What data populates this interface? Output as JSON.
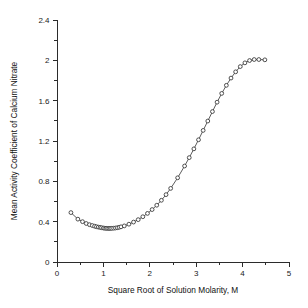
{
  "chart_data": {
    "type": "scatter",
    "title": "",
    "xlabel": "Square Root of Solution Molarity, M",
    "ylabel": "Mean Activity Coefficient of Calcium Nitrate",
    "xlim": [
      0,
      5
    ],
    "ylim": [
      0,
      2.4
    ],
    "xticks": [
      0,
      1,
      2,
      3,
      4,
      5
    ],
    "yticks": [
      0,
      0.4,
      0.8,
      1.2,
      1.6,
      2,
      2.4
    ],
    "xtick_labels": [
      "0",
      "1",
      "2",
      "3",
      "4",
      "5"
    ],
    "ytick_labels": [
      "0",
      "0.4",
      "0.8",
      "1.2",
      "1.6",
      "2",
      "2.4"
    ],
    "xminor_step": 0.5,
    "yminor_step": 0.2,
    "grid": false,
    "legend": null,
    "marker": "open-circle",
    "line_style": "solid",
    "line_color": "#4a4a4a",
    "marker_edge_color": "#333333",
    "marker_face_color": "#ffffff",
    "axis_color": "#2b2b2b",
    "background_color": "#ffffff",
    "series": [
      {
        "name": "Calcium Nitrate",
        "points": [
          [
            0.3,
            0.49
          ],
          [
            0.45,
            0.425
          ],
          [
            0.55,
            0.4
          ],
          [
            0.63,
            0.382
          ],
          [
            0.7,
            0.37
          ],
          [
            0.76,
            0.362
          ],
          [
            0.81,
            0.355
          ],
          [
            0.85,
            0.35
          ],
          [
            0.89,
            0.346
          ],
          [
            0.93,
            0.343
          ],
          [
            0.96,
            0.34
          ],
          [
            1.0,
            0.337
          ],
          [
            1.03,
            0.335
          ],
          [
            1.06,
            0.334
          ],
          [
            1.09,
            0.333
          ],
          [
            1.12,
            0.333
          ],
          [
            1.15,
            0.333
          ],
          [
            1.18,
            0.334
          ],
          [
            1.22,
            0.335
          ],
          [
            1.26,
            0.337
          ],
          [
            1.3,
            0.34
          ],
          [
            1.34,
            0.344
          ],
          [
            1.38,
            0.349
          ],
          [
            1.45,
            0.358
          ],
          [
            1.55,
            0.375
          ],
          [
            1.65,
            0.396
          ],
          [
            1.75,
            0.42
          ],
          [
            1.85,
            0.449
          ],
          [
            1.95,
            0.482
          ],
          [
            2.05,
            0.52
          ],
          [
            2.15,
            0.563
          ],
          [
            2.25,
            0.612
          ],
          [
            2.35,
            0.668
          ],
          [
            2.45,
            0.73
          ],
          [
            2.6,
            0.835
          ],
          [
            2.75,
            0.952
          ],
          [
            2.85,
            1.035
          ],
          [
            2.95,
            1.122
          ],
          [
            3.05,
            1.212
          ],
          [
            3.15,
            1.305
          ],
          [
            3.25,
            1.398
          ],
          [
            3.35,
            1.492
          ],
          [
            3.45,
            1.585
          ],
          [
            3.55,
            1.672
          ],
          [
            3.65,
            1.752
          ],
          [
            3.75,
            1.824
          ],
          [
            3.85,
            1.886
          ],
          [
            3.95,
            1.938
          ],
          [
            4.05,
            1.975
          ],
          [
            4.15,
            1.998
          ],
          [
            4.25,
            2.008
          ],
          [
            4.35,
            2.008
          ],
          [
            4.48,
            2.005
          ]
        ]
      }
    ]
  }
}
